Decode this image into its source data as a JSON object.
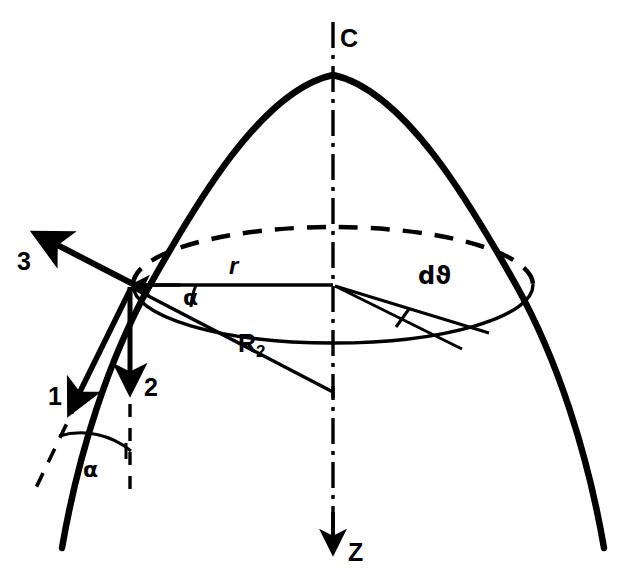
{
  "figure": {
    "type": "technical-line-diagram",
    "background_color": "#ffffff",
    "stroke_color": "#000000"
  },
  "labels": {
    "axis_top": "C",
    "axis_bottom": "Z",
    "vector_1": "1",
    "vector_2": "2",
    "vector_3": "3",
    "radius_r": "r",
    "angle_alpha_upper": "α",
    "angle_alpha_lower": "α",
    "angle_increment": "dϑ",
    "radius_of_curvature": "R",
    "radius_of_curvature_subscript": "2"
  },
  "geometry": {
    "apex": {
      "x": 333,
      "y": 75
    },
    "surface_point": {
      "x": 130,
      "y": 285
    },
    "axis_line": {
      "x": 333,
      "y_top": 22,
      "y_bottom": 548
    },
    "ellipse_center": {
      "x": 333,
      "y": 285
    },
    "ellipse_rx": 200,
    "ellipse_ry": 58,
    "r_line": {
      "x1": 130,
      "y1": 285,
      "x2": 333,
      "y2": 285
    },
    "r2_line": {
      "x1": 130,
      "y1": 285,
      "x2": 333,
      "y2": 392
    },
    "vector_3_tip": {
      "x": 33,
      "y": 231
    },
    "vector_2_tip": {
      "x": 130,
      "y": 397
    },
    "vector_1_tip": {
      "x": 66,
      "y": 414
    }
  },
  "line_styles": {
    "paraboloid_outline": "solid-thick",
    "hidden_ellipse_back": "dashed",
    "visible_ellipse_front": "solid-thin",
    "symmetry_axis": "dash-dot",
    "vertical_reference": "dashed",
    "tangent_extension": "dashed"
  }
}
